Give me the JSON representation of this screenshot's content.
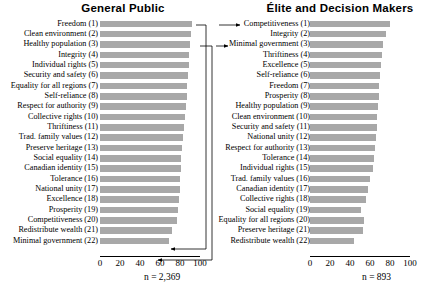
{
  "figure": {
    "caption_left_n": "n = 2,369",
    "caption_right_n": "n = 893",
    "bar_color": "#a8a8a8",
    "axis_color": "#000000",
    "connector_color": "#000000"
  },
  "panels": {
    "left": {
      "title": "General Public",
      "n_label": "n = 2,369",
      "ticks": [
        "0",
        "20",
        "40",
        "60",
        "80",
        "100"
      ],
      "tick_values": [
        0,
        20,
        40,
        60,
        80,
        100
      ]
    },
    "right": {
      "title": "Élite and Decision Makers",
      "n_label": "n = 893",
      "ticks": [
        "0",
        "20",
        "40",
        "60",
        "80",
        "100"
      ],
      "tick_values": [
        0,
        20,
        40,
        60,
        80,
        100
      ]
    }
  },
  "chart_data": [
    {
      "type": "bar",
      "title": "General Public",
      "orientation": "horizontal",
      "xlabel": "",
      "ylabel": "",
      "xlim": [
        0,
        100
      ],
      "grid": false,
      "legend": "none",
      "sample_size": "n = 2,369",
      "categories": [
        "Freedom (1)",
        "Clean environment (2)",
        "Healthy population (3)",
        "Integrity (4)",
        "Individual rights (5)",
        "Security and safety (6)",
        "Equality for all regions (7)",
        "Self-reliance (8)",
        "Respect for authority (9)",
        "Collective rights (10)",
        "Thriftiness (11)",
        "Trad. family values (12)",
        "Preserve heritage (13)",
        "Social equality (14)",
        "Canadian identity (15)",
        "Tolerance (16)",
        "National unity (17)",
        "Excellence (18)",
        "Prosperity (19)",
        "Competitiveness (20)",
        "Redistribute wealth (21)",
        "Minimal government (22)"
      ],
      "values": [
        92,
        91,
        90,
        89,
        89,
        88,
        87,
        87,
        86,
        85,
        84,
        83,
        82,
        81,
        81,
        80,
        80,
        79,
        78,
        77,
        72,
        69
      ]
    },
    {
      "type": "bar",
      "title": "Élite and Decision Makers",
      "orientation": "horizontal",
      "xlabel": "",
      "ylabel": "",
      "xlim": [
        0,
        100
      ],
      "grid": false,
      "legend": "none",
      "sample_size": "n = 893",
      "categories": [
        "Competitiveness (1)",
        "Integrity (2)",
        "Minimal government (3)",
        "Thriftiness (4)",
        "Excellence (5)",
        "Self-reliance (6)",
        "Freedom (7)",
        "Prosperity (8)",
        "Healthy population (9)",
        "Clean environment (10)",
        "Security and safety (11)",
        "National unity (12)",
        "Respect for authority (13)",
        "Tolerance (14)",
        "Individual rights (15)",
        "Trad. family values (16)",
        "Canadian identity (17)",
        "Collective rights (18)",
        "Social equality (19)",
        "Equality for all regions (20)",
        "Preserve heritage (21)",
        "Redistribute wealth (22)"
      ],
      "values": [
        80,
        76,
        73,
        72,
        71,
        70,
        69,
        69,
        68,
        67,
        67,
        66,
        65,
        64,
        63,
        60,
        58,
        56,
        51,
        54,
        53,
        44
      ]
    }
  ],
  "connectors": [
    {
      "label": "competitiveness-link",
      "from_panel": "left",
      "from_category": "Competitiveness (20)",
      "to_panel": "right",
      "to_category": "Competitiveness (1)"
    },
    {
      "label": "minimal-government-link",
      "from_panel": "left",
      "from_category": "Minimal government (22)",
      "to_panel": "right",
      "to_category": "Minimal government (3)"
    }
  ]
}
